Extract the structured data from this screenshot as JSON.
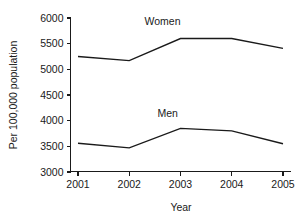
{
  "chart_data": {
    "type": "line",
    "title": "",
    "xlabel": "Year",
    "ylabel": "Per 100,000 population",
    "categories": [
      "2001",
      "2002",
      "2003",
      "2004",
      "2005"
    ],
    "x": [
      2001,
      2002,
      2003,
      2004,
      2005
    ],
    "xlim": [
      2001,
      2005
    ],
    "ylim": [
      3000,
      6000
    ],
    "yticks": [
      "6000",
      "5500",
      "5000",
      "4500",
      "4000",
      "3500",
      "3000"
    ],
    "ytick_values": [
      6000,
      5500,
      5000,
      4500,
      4000,
      3500,
      3000
    ],
    "xticks": [
      "2001",
      "2002",
      "2003",
      "2004",
      "2005"
    ],
    "grid": false,
    "legend": "inline-labels",
    "series": [
      {
        "name": "Women",
        "label": "Women",
        "color": "#1a1a1a",
        "values": [
          5250,
          5170,
          5600,
          5600,
          5410
        ]
      },
      {
        "name": "Men",
        "label": "Men",
        "color": "#1a1a1a",
        "values": [
          3560,
          3470,
          3850,
          3800,
          3550
        ]
      }
    ],
    "annotations": [
      {
        "text": "Women",
        "x": 2002.65,
        "y": 5870
      },
      {
        "text": "Men",
        "x": 2002.75,
        "y": 4080
      }
    ]
  },
  "colors": {
    "ink": "#1a1a1a",
    "background": "#ffffff"
  }
}
